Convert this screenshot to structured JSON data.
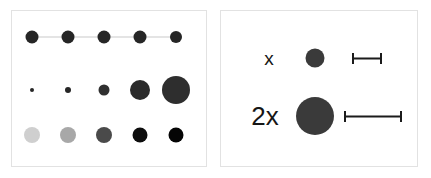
{
  "figure": {
    "title": "",
    "background_color": "#ffffff",
    "panel_border_color": "#e2e2e2"
  },
  "chart_data": {
    "type": "scatter",
    "title": "",
    "xlabel": "",
    "ylabel": "",
    "grid": false,
    "legend_position": "none",
    "panels": [
      {
        "name": "left-panel",
        "description": "Three rows of five circular marks demonstrating constant size, increasing size, and increasing darkness",
        "rows": [
          {
            "name": "constant-size-row",
            "encoding": "size-constant-with-connector",
            "connector": true,
            "connector_color": "#c9c9c9",
            "marks": [
              {
                "x": 20,
                "y": 26,
                "diameter": 13,
                "color": "#262626"
              },
              {
                "x": 56,
                "y": 26,
                "diameter": 13,
                "color": "#262626"
              },
              {
                "x": 92,
                "y": 26,
                "diameter": 13,
                "color": "#262626"
              },
              {
                "x": 128,
                "y": 26,
                "diameter": 13,
                "color": "#262626"
              },
              {
                "x": 164,
                "y": 26,
                "diameter": 12,
                "color": "#262626"
              }
            ]
          },
          {
            "name": "increasing-size-row",
            "encoding": "size",
            "connector": false,
            "marks": [
              {
                "x": 20,
                "y": 79,
                "diameter": 4,
                "color": "#262626"
              },
              {
                "x": 56,
                "y": 79,
                "diameter": 6,
                "color": "#262626"
              },
              {
                "x": 92,
                "y": 79,
                "diameter": 11,
                "color": "#303030"
              },
              {
                "x": 128,
                "y": 79,
                "diameter": 20,
                "color": "#2b2b2b"
              },
              {
                "x": 164,
                "y": 79,
                "diameter": 28,
                "color": "#2e2e2e"
              }
            ]
          },
          {
            "name": "increasing-darkness-row",
            "encoding": "lightness",
            "connector": false,
            "marks": [
              {
                "x": 20,
                "y": 124,
                "diameter": 16,
                "color": "#cfcfcf"
              },
              {
                "x": 56,
                "y": 124,
                "diameter": 16,
                "color": "#a8a8a8"
              },
              {
                "x": 92,
                "y": 124,
                "diameter": 16,
                "color": "#4a4a4a"
              },
              {
                "x": 128,
                "y": 124,
                "diameter": 15,
                "color": "#0d0d0d"
              },
              {
                "x": 164,
                "y": 124,
                "diameter": 15,
                "color": "#050505"
              }
            ]
          }
        ]
      },
      {
        "name": "right-panel",
        "description": "Legend comparing a base magnitude x against a doubled magnitude 2x, shown as a circle area and a length bar",
        "rows": [
          {
            "name": "magnitude-x-row",
            "label": "x",
            "label_size": "small",
            "label_x": 48,
            "label_y": 47,
            "circle": {
              "x": 94,
              "y": 47,
              "diameter": 19,
              "color": "#3a3a3a"
            },
            "bar": {
              "x": 146,
              "y": 47,
              "length": 30,
              "color": "#1b1b1b"
            }
          },
          {
            "name": "magnitude-2x-row",
            "label": "2x",
            "label_size": "large",
            "label_x": 44,
            "label_y": 105,
            "circle": {
              "x": 94,
              "y": 105,
              "diameter": 38,
              "color": "#3a3a3a"
            },
            "bar": {
              "x": 152,
              "y": 105,
              "length": 58,
              "color": "#1b1b1b"
            }
          }
        ]
      }
    ]
  }
}
